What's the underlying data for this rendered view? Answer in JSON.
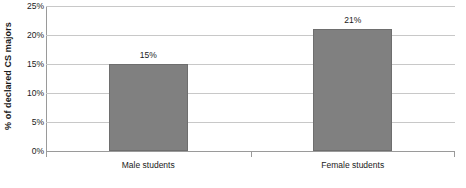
{
  "chart_data": {
    "type": "bar",
    "title": "",
    "subtitle": "",
    "xlabel": "",
    "ylabel": "% of declared CS majors",
    "categories": [
      "Male students",
      "Female students"
    ],
    "values": [
      15,
      21
    ],
    "value_labels": [
      "15%",
      "21%"
    ],
    "ylim": [
      0,
      25
    ],
    "ytick_values": [
      0,
      5,
      10,
      15,
      20,
      25
    ],
    "ytick_labels": [
      "0%",
      "5%",
      "10%",
      "15%",
      "20%",
      "25%"
    ],
    "grid": true,
    "legend": "none",
    "series": [
      {
        "name": "% of declared CS majors",
        "values": [
          15,
          21
        ],
        "color": "#808080"
      }
    ]
  },
  "style": {
    "bar_fill": "#808080",
    "bar_border": "#6e6e6e",
    "gridline_color": "#c8c8c8",
    "axis_color": "#9a9a9a",
    "text_color": "#1a1a1a",
    "background": "#ffffff"
  }
}
